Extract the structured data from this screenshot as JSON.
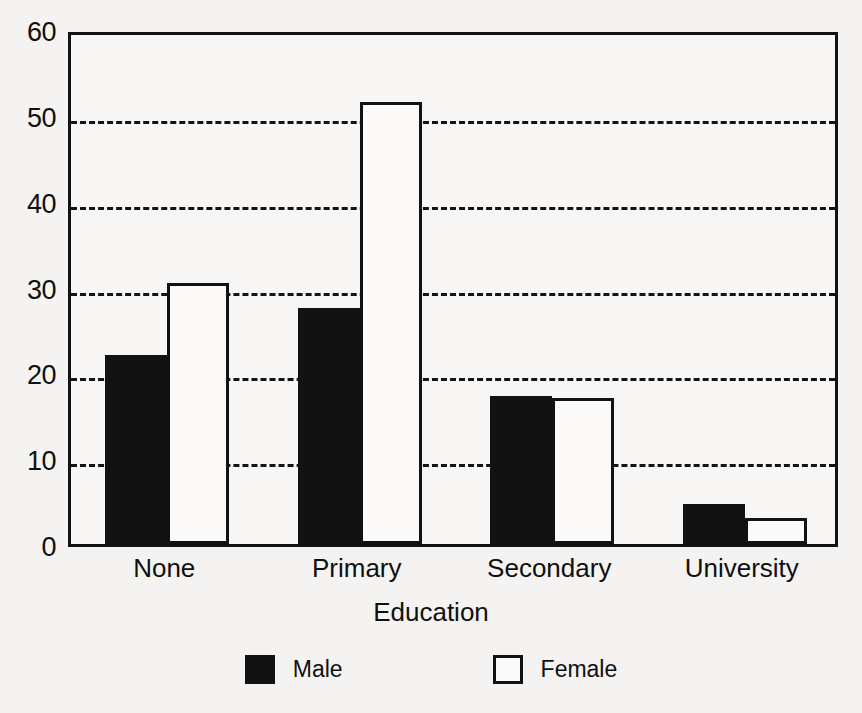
{
  "chart_data": {
    "type": "bar",
    "title": "",
    "subtitle": "",
    "xlabel": "Education",
    "ylabel": "",
    "categories": [
      "None",
      "Primary",
      "Secondary",
      "University"
    ],
    "series": [
      {
        "name": "Male",
        "color": "#121212",
        "fill": "solid",
        "values": [
          22.0,
          27.5,
          17.3,
          4.7
        ]
      },
      {
        "name": "Female",
        "color": "#ffffff",
        "fill": "outlined",
        "values": [
          30.4,
          51.5,
          17.0,
          3.0
        ]
      }
    ],
    "ylim": [
      0,
      60
    ],
    "yticks": [
      0,
      10,
      20,
      30,
      40,
      50,
      60
    ],
    "ytick_labels": [
      "0",
      "10",
      "20",
      "30",
      "40",
      "50",
      "60"
    ],
    "grid": true,
    "grid_style": "dashed",
    "grid_axis": "y",
    "legend_position": "bottom",
    "bar_grouping": "grouped",
    "annotations": []
  },
  "legend": {
    "entries": [
      {
        "label": "Male",
        "swatch": "filled-square"
      },
      {
        "label": "Female",
        "swatch": "outlined-square"
      }
    ]
  },
  "colors": {
    "background": "#f4f3f1",
    "plot_background": "#f7f6f4",
    "axis": "#121212",
    "grid": "#141414",
    "male": "#121212",
    "female": "#fbfaf8"
  }
}
